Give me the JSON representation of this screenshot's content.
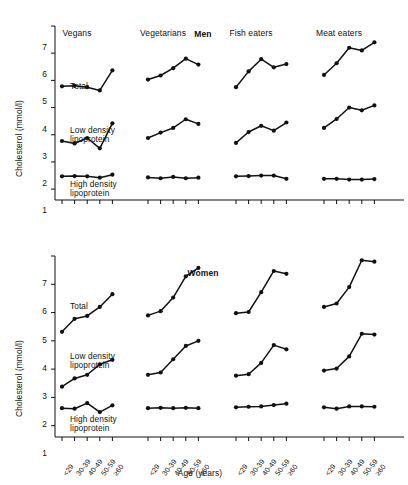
{
  "figure": {
    "ylabel": "Cholesterol (mmol/l)",
    "xlabel": "Age (years)",
    "series_label_total": "Total",
    "series_label_ldl": "Low density\nlipoprotein",
    "series_label_hdl": "High density\nlipoprotein",
    "series_label_ldl_line1": "Low density",
    "series_label_ldl_line2": "lipoprotein",
    "series_label_hdl_line1": "High density",
    "series_label_hdl_line2": "lipoprotein",
    "line_color": "#111111",
    "marker_color": "#111111"
  },
  "panels": {
    "men": {
      "title": "Men"
    },
    "women": {
      "title": "Women"
    }
  },
  "groups": [
    {
      "label": "Vegans"
    },
    {
      "label": "Vegetarians"
    },
    {
      "label": "Fish eaters"
    },
    {
      "label": "Meat eaters"
    }
  ],
  "yticks": [
    "1",
    "2",
    "3",
    "4",
    "5",
    "6",
    "7"
  ],
  "xticks": [
    "<29",
    "30-39",
    "40-49",
    "50-59",
    "≥60"
  ],
  "chart_data": {
    "type": "line",
    "xlabel": "Age (years)",
    "ylabel": "Cholesterol (mmol/l)",
    "ylim": [
      0.6,
      7
    ],
    "grid": false,
    "legend": "inline-labels",
    "categories": [
      "<29",
      "30-39",
      "40-49",
      "50-59",
      "≥60"
    ],
    "panels": [
      {
        "name": "Men",
        "groups": [
          {
            "name": "Vegans",
            "series": [
              {
                "name": "Total",
                "values": [
                  4.78,
                  4.8,
                  4.75,
                  4.63,
                  5.37
                ]
              },
              {
                "name": "Low density lipoprotein",
                "values": [
                  2.77,
                  2.68,
                  2.88,
                  2.5,
                  3.42
                ]
              },
              {
                "name": "High density lipoprotein",
                "values": [
                  1.47,
                  1.48,
                  1.47,
                  1.42,
                  1.53
                ]
              }
            ]
          },
          {
            "name": "Vegetarians",
            "series": [
              {
                "name": "Total",
                "values": [
                  5.03,
                  5.18,
                  5.45,
                  5.8,
                  5.58
                ]
              },
              {
                "name": "Low density lipoprotein",
                "values": [
                  2.88,
                  3.08,
                  3.25,
                  3.57,
                  3.4
                ]
              },
              {
                "name": "High density lipoprotein",
                "values": [
                  1.43,
                  1.4,
                  1.45,
                  1.4,
                  1.42
                ]
              }
            ]
          },
          {
            "name": "Fish eaters",
            "series": [
              {
                "name": "Total",
                "values": [
                  4.75,
                  5.33,
                  5.78,
                  5.48,
                  5.6
                ]
              },
              {
                "name": "Low density lipoprotein",
                "values": [
                  2.7,
                  3.1,
                  3.33,
                  3.15,
                  3.45
                ]
              },
              {
                "name": "High density lipoprotein",
                "values": [
                  1.47,
                  1.48,
                  1.5,
                  1.5,
                  1.38
                ]
              }
            ]
          },
          {
            "name": "Meat eaters",
            "series": [
              {
                "name": "Total",
                "values": [
                  5.2,
                  5.63,
                  6.2,
                  6.1,
                  6.4
                ]
              },
              {
                "name": "Low density lipoprotein",
                "values": [
                  3.25,
                  3.58,
                  4.0,
                  3.9,
                  4.08
                ]
              },
              {
                "name": "High density lipoprotein",
                "values": [
                  1.38,
                  1.38,
                  1.35,
                  1.35,
                  1.37
                ]
              }
            ]
          }
        ]
      },
      {
        "name": "Women",
        "groups": [
          {
            "name": "Vegans",
            "series": [
              {
                "name": "Total",
                "values": [
                  4.32,
                  4.78,
                  4.88,
                  5.2,
                  5.65
                ]
              },
              {
                "name": "Low density lipoprotein",
                "values": [
                  2.38,
                  2.67,
                  2.8,
                  3.17,
                  3.33
                ]
              },
              {
                "name": "High density lipoprotein",
                "values": [
                  1.62,
                  1.6,
                  1.8,
                  1.48,
                  1.72
                ]
              }
            ]
          },
          {
            "name": "Vegetarians",
            "series": [
              {
                "name": "Total",
                "values": [
                  4.9,
                  5.05,
                  5.53,
                  6.28,
                  6.58
                ]
              },
              {
                "name": "Low density lipoprotein",
                "values": [
                  2.8,
                  2.88,
                  3.35,
                  3.82,
                  4.0
                ]
              },
              {
                "name": "High density lipoprotein",
                "values": [
                  1.62,
                  1.63,
                  1.62,
                  1.63,
                  1.62
                ]
              }
            ]
          },
          {
            "name": "Fish eaters",
            "series": [
              {
                "name": "Total",
                "values": [
                  4.98,
                  5.02,
                  5.72,
                  6.47,
                  6.37
                ]
              },
              {
                "name": "Low density lipoprotein",
                "values": [
                  2.77,
                  2.82,
                  3.22,
                  3.85,
                  3.7
                ]
              },
              {
                "name": "High density lipoprotein",
                "values": [
                  1.65,
                  1.67,
                  1.68,
                  1.73,
                  1.78
                ]
              }
            ]
          },
          {
            "name": "Meat eaters",
            "series": [
              {
                "name": "Total",
                "values": [
                  5.2,
                  5.32,
                  5.9,
                  6.85,
                  6.8
                ]
              },
              {
                "name": "Low density lipoprotein",
                "values": [
                  2.95,
                  3.02,
                  3.45,
                  4.25,
                  4.22
                ]
              },
              {
                "name": "High density lipoprotein",
                "values": [
                  1.65,
                  1.6,
                  1.68,
                  1.68,
                  1.67
                ]
              }
            ]
          }
        ]
      }
    ]
  }
}
